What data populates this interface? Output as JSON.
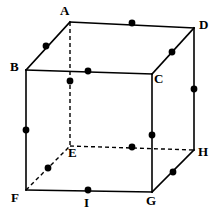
{
  "figure": {
    "type": "geometry-diagram",
    "width": 218,
    "height": 222,
    "background_color": "#ffffff",
    "stroke_color": "#000000",
    "dot_color": "#000000",
    "solid_stroke_width": 1.6,
    "dashed_stroke_width": 1.4,
    "dash_pattern": "4,3",
    "dot_radius": 3.4
  },
  "vertices": [
    {
      "id": "A",
      "label": "A",
      "x": 70,
      "y": 22,
      "label_x": 60,
      "label_y": 4,
      "hidden": false
    },
    {
      "id": "D",
      "label": "D",
      "x": 194,
      "y": 28,
      "label_x": 199,
      "label_y": 18,
      "hidden": false
    },
    {
      "id": "B",
      "label": "B",
      "x": 26,
      "y": 70,
      "label_x": 10,
      "label_y": 60,
      "hidden": false
    },
    {
      "id": "C",
      "label": "C",
      "x": 152,
      "y": 74,
      "label_x": 154,
      "label_y": 72,
      "hidden": false
    },
    {
      "id": "E",
      "label": "E",
      "x": 70,
      "y": 146,
      "label_x": 68,
      "label_y": 146,
      "hidden": true
    },
    {
      "id": "H",
      "label": "H",
      "x": 194,
      "y": 150,
      "label_x": 198,
      "label_y": 145,
      "hidden": false
    },
    {
      "id": "F",
      "label": "F",
      "x": 26,
      "y": 190,
      "label_x": 11,
      "label_y": 191,
      "hidden": false
    },
    {
      "id": "G",
      "label": "G",
      "x": 152,
      "y": 192,
      "label_x": 146,
      "label_y": 194,
      "hidden": false
    }
  ],
  "edges": [
    {
      "id": "AD",
      "from": "A",
      "to": "D",
      "style": "solid",
      "x1": 70,
      "y1": 22,
      "x2": 194,
      "y2": 28
    },
    {
      "id": "BA",
      "from": "B",
      "to": "A",
      "style": "solid",
      "x1": 26,
      "y1": 70,
      "x2": 70,
      "y2": 22
    },
    {
      "id": "BC",
      "from": "B",
      "to": "C",
      "style": "solid",
      "x1": 26,
      "y1": 70,
      "x2": 152,
      "y2": 74
    },
    {
      "id": "CD",
      "from": "C",
      "to": "D",
      "style": "solid",
      "x1": 152,
      "y1": 74,
      "x2": 194,
      "y2": 28
    },
    {
      "id": "BF",
      "from": "B",
      "to": "F",
      "style": "solid",
      "x1": 26,
      "y1": 70,
      "x2": 26,
      "y2": 190
    },
    {
      "id": "CG",
      "from": "C",
      "to": "G",
      "style": "solid",
      "x1": 152,
      "y1": 74,
      "x2": 152,
      "y2": 192
    },
    {
      "id": "DH",
      "from": "D",
      "to": "H",
      "style": "solid",
      "x1": 194,
      "y1": 28,
      "x2": 194,
      "y2": 150
    },
    {
      "id": "FG",
      "from": "F",
      "to": "G",
      "style": "solid",
      "x1": 26,
      "y1": 190,
      "x2": 152,
      "y2": 192
    },
    {
      "id": "GH",
      "from": "G",
      "to": "H",
      "style": "solid",
      "x1": 152,
      "y1": 192,
      "x2": 194,
      "y2": 150
    },
    {
      "id": "AE",
      "from": "A",
      "to": "E",
      "style": "dashed",
      "x1": 70,
      "y1": 22,
      "x2": 70,
      "y2": 146
    },
    {
      "id": "EH",
      "from": "E",
      "to": "H",
      "style": "dashed",
      "x1": 70,
      "y1": 146,
      "x2": 194,
      "y2": 150
    },
    {
      "id": "FE",
      "from": "F",
      "to": "E",
      "style": "dashed",
      "x1": 26,
      "y1": 190,
      "x2": 70,
      "y2": 146
    }
  ],
  "midpoint_dots": [
    {
      "id": "mid-AD",
      "edge": "AD",
      "x": 132,
      "y": 23
    },
    {
      "id": "mid-BA",
      "edge": "BA",
      "x": 46,
      "y": 46
    },
    {
      "id": "mid-BC",
      "edge": "BC",
      "x": 88,
      "y": 71
    },
    {
      "id": "mid-CD",
      "edge": "CD",
      "x": 172,
      "y": 52
    },
    {
      "id": "mid-AE",
      "edge": "AE",
      "x": 70,
      "y": 81
    },
    {
      "id": "mid-BF",
      "edge": "BF",
      "x": 26,
      "y": 130
    },
    {
      "id": "mid-DH",
      "edge": "DH",
      "x": 194,
      "y": 89
    },
    {
      "id": "mid-CG",
      "edge": "CG",
      "x": 152,
      "y": 135
    },
    {
      "id": "mid-EH",
      "edge": "EH",
      "x": 132,
      "y": 147
    },
    {
      "id": "mid-FE",
      "edge": "FE",
      "x": 48,
      "y": 168
    },
    {
      "id": "mid-GH",
      "edge": "GH",
      "x": 173,
      "y": 172
    },
    {
      "id": "mid-FG",
      "edge": "FG",
      "x": 88,
      "y": 190
    }
  ],
  "extra_labels": [
    {
      "id": "I",
      "label": "I",
      "x": 88,
      "y": 192,
      "label_x": 84,
      "label_y": 196
    }
  ]
}
